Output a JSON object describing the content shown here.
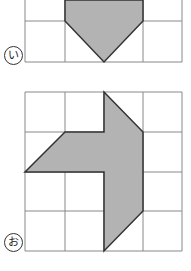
{
  "figures": [
    {
      "label": "い",
      "shape": "pentagon pointing down (top cut off)",
      "fill": "#b3b3b3",
      "stroke": "#333333"
    },
    {
      "label": "お",
      "shape": "L-shaped polygon with slanted edges",
      "fill": "#b3b3b3",
      "stroke": "#333333"
    }
  ],
  "grid": {
    "line_color": "#888888",
    "columns": 4
  }
}
